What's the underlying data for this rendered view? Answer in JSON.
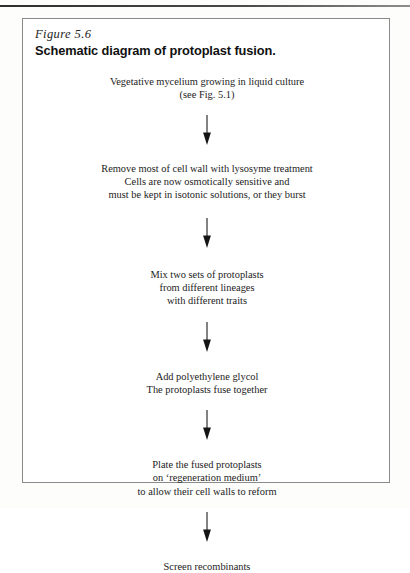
{
  "figure": {
    "number": "Figure 5.6",
    "title": "Schematic diagram of protoplast fusion.",
    "arrow_icon": "down-arrow-icon"
  },
  "flow": {
    "steps": [
      {
        "id": "step-vegetative-mycelium",
        "text": "Vegetative mycelium growing in liquid culture\n(see Fig. 5.1)"
      },
      {
        "id": "step-remove-cell-wall",
        "text": "Remove most of cell wall with lysosyme treatment\nCells are now osmotically sensitive and\nmust be kept in isotonic solutions, or they burst"
      },
      {
        "id": "step-mix-protoplasts",
        "text": "Mix two sets of protoplasts\nfrom different lineages\nwith different traits"
      },
      {
        "id": "step-add-peg",
        "text": "Add polyethylene glycol\nThe protoplasts fuse together"
      },
      {
        "id": "step-plate-regeneration",
        "text": "Plate the fused protoplasts\non ‘regeneration medium’\nto allow their cell walls to reform"
      },
      {
        "id": "step-screen-recombinants",
        "text": "Screen recombinants"
      }
    ]
  },
  "colors": {
    "ink": "#1a1a1a",
    "frame": "#8a8a8a",
    "rule": "#2e2e2e",
    "page": "#ffffff"
  }
}
